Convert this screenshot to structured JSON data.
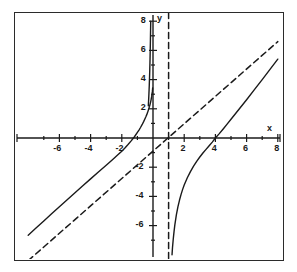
{
  "chart_data": {
    "type": "line",
    "title": "",
    "subtitle": "",
    "xlabel": "x",
    "ylabel": "y",
    "xlim": [
      -8,
      8
    ],
    "ylim": [
      -8,
      8
    ],
    "grid": false,
    "legend": "none",
    "x_ticks_major": [
      -6,
      -4,
      -2,
      2,
      4,
      6,
      8
    ],
    "x_tick_labels": [
      "-6",
      "-4",
      "-2",
      "2",
      "4",
      "6",
      "8"
    ],
    "x_ticks_minor": [
      -7,
      -5,
      -3,
      -1,
      1,
      3,
      5,
      7
    ],
    "y_ticks_major": [
      8,
      6,
      4,
      2,
      -2,
      -4,
      -6
    ],
    "y_tick_labels": [
      "8",
      "6",
      "4",
      "2",
      "-2",
      "-4",
      "-6"
    ],
    "y_ticks_minor": [
      7,
      5,
      3,
      1,
      -1,
      -3,
      -5,
      -7
    ],
    "annotations": [
      {
        "name": "x-intercept-left",
        "x": -2,
        "y": 0
      },
      {
        "name": "x-intercept-right",
        "x": 4,
        "y": 0
      },
      {
        "name": "vertical-asymptote",
        "x": 1
      },
      {
        "name": "slant-asymptote-slope",
        "value": 1
      },
      {
        "name": "slant-asymptote-intercept",
        "value": -1
      }
    ],
    "series": [
      {
        "name": "rational-curve-left-branch",
        "style": "solid",
        "color": "#1a1a1a",
        "points": [
          [
            -8.0,
            -6.66
          ],
          [
            -7.5,
            -6.17
          ],
          [
            -7.0,
            -5.68
          ],
          [
            -6.5,
            -5.19
          ],
          [
            -6.0,
            -4.71
          ],
          [
            -5.5,
            -4.23
          ],
          [
            -5.0,
            -3.75
          ],
          [
            -4.5,
            -3.27
          ],
          [
            -4.0,
            -2.8
          ],
          [
            -3.5,
            -2.33
          ],
          [
            -3.0,
            -1.87
          ],
          [
            -2.6,
            -1.49
          ],
          [
            -2.2,
            -1.1
          ],
          [
            -2.0,
            -0.9
          ],
          [
            -1.8,
            -0.68
          ],
          [
            -1.6,
            -0.45
          ],
          [
            -1.4,
            -0.2
          ],
          [
            -1.2,
            0.07
          ],
          [
            -1.0,
            0.38
          ],
          [
            -0.9,
            0.54
          ],
          [
            -0.8,
            0.72
          ],
          [
            -0.7,
            0.91
          ],
          [
            -0.6,
            1.12
          ],
          [
            -0.5,
            1.35
          ],
          [
            -0.45,
            1.47
          ],
          [
            -0.4,
            1.6
          ],
          [
            -0.35,
            1.74
          ],
          [
            -0.3,
            1.9
          ],
          [
            -0.25,
            2.07
          ],
          [
            -0.22,
            2.18
          ],
          [
            -0.2,
            2.26
          ],
          [
            -0.18,
            2.34
          ],
          [
            -0.16,
            2.43
          ],
          [
            -0.14,
            2.53
          ],
          [
            -0.12,
            2.63
          ],
          [
            -0.11,
            2.69
          ],
          [
            -0.1,
            2.75
          ],
          [
            -0.09,
            2.81
          ],
          [
            -0.08,
            2.88
          ],
          [
            -0.07,
            2.95
          ],
          [
            -0.06,
            3.03
          ],
          [
            -0.055,
            3.07
          ],
          [
            -0.05,
            3.12
          ],
          [
            -0.045,
            3.16
          ],
          [
            -0.04,
            3.21
          ],
          [
            -0.035,
            3.27
          ],
          [
            -0.03,
            3.32
          ],
          [
            -0.028,
            3.34
          ],
          [
            -0.026,
            3.37
          ],
          [
            -0.024,
            3.4
          ],
          [
            -0.022,
            3.42
          ]
        ]
      },
      {
        "name": "rational-curve-left-branch-upper",
        "style": "solid",
        "color": "#1a1a1a",
        "points": [
          [
            -0.3,
            2.2
          ],
          [
            -0.28,
            2.6
          ],
          [
            -0.26,
            3.05
          ],
          [
            -0.25,
            3.3
          ],
          [
            -0.24,
            3.58
          ],
          [
            -0.23,
            3.88
          ],
          [
            -0.22,
            4.2
          ],
          [
            -0.215,
            4.38
          ],
          [
            -0.21,
            4.56
          ],
          [
            -0.205,
            4.76
          ],
          [
            -0.2,
            4.96
          ],
          [
            -0.195,
            5.18
          ],
          [
            -0.19,
            5.4
          ],
          [
            -0.185,
            5.64
          ],
          [
            -0.18,
            5.9
          ],
          [
            -0.175,
            6.16
          ],
          [
            -0.17,
            6.44
          ],
          [
            -0.165,
            6.74
          ],
          [
            -0.16,
            7.05
          ],
          [
            -0.155,
            7.38
          ],
          [
            -0.15,
            7.72
          ],
          [
            -0.147,
            7.94
          ],
          [
            -0.145,
            8.0
          ]
        ]
      },
      {
        "name": "rational-curve-right-branch",
        "style": "solid",
        "color": "#1a1a1a",
        "points": [
          [
            1.22,
            -8.0
          ],
          [
            1.25,
            -7.5
          ],
          [
            1.3,
            -6.9
          ],
          [
            1.35,
            -6.4
          ],
          [
            1.4,
            -5.95
          ],
          [
            1.5,
            -5.25
          ],
          [
            1.6,
            -4.7
          ],
          [
            1.7,
            -4.25
          ],
          [
            1.8,
            -3.86
          ],
          [
            1.9,
            -3.52
          ],
          [
            2.0,
            -3.22
          ],
          [
            2.2,
            -2.72
          ],
          [
            2.4,
            -2.3
          ],
          [
            2.6,
            -1.93
          ],
          [
            2.8,
            -1.6
          ],
          [
            3.0,
            -1.3
          ],
          [
            3.2,
            -1.03
          ],
          [
            3.4,
            -0.78
          ],
          [
            3.6,
            -0.53
          ],
          [
            3.8,
            -0.28
          ],
          [
            4.0,
            0.0
          ],
          [
            4.25,
            0.3
          ],
          [
            4.5,
            0.62
          ],
          [
            4.75,
            0.95
          ],
          [
            5.0,
            1.28
          ],
          [
            5.5,
            1.95
          ],
          [
            6.0,
            2.62
          ],
          [
            6.5,
            3.31
          ],
          [
            7.0,
            4.0
          ],
          [
            7.5,
            4.7
          ],
          [
            8.0,
            5.4
          ]
        ]
      },
      {
        "name": "slant-asymptote",
        "style": "dashed",
        "color": "#1a1a1a",
        "points": [
          [
            -8.0,
            -8.4
          ],
          [
            8.0,
            6.6
          ]
        ]
      },
      {
        "name": "vertical-asymptote-line",
        "style": "dashed",
        "color": "#1a1a1a",
        "points": [
          [
            1.0,
            8.6
          ],
          [
            1.0,
            -8.6
          ]
        ]
      }
    ]
  },
  "axis_labels": {
    "x": "x",
    "y": "y"
  }
}
